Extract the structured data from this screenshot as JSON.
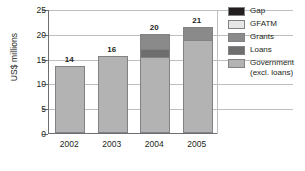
{
  "chart_data": {
    "type": "bar",
    "subtype": "stacked-bar",
    "title": "",
    "xlabel": "",
    "ylabel": "US$ millions",
    "categories": [
      "2002",
      "2003",
      "2004",
      "2005"
    ],
    "ylim": [
      0,
      25
    ],
    "yticks": [
      0,
      5,
      10,
      15,
      20,
      25
    ],
    "ytick_labels": [
      "0",
      "5",
      "10",
      "15",
      "20",
      "25"
    ],
    "grid": true,
    "grid_axis": "y",
    "legend_position": "right",
    "data_labels": [
      "14",
      "16",
      "20",
      "21"
    ],
    "totals": [
      13.5,
      15.5,
      20.0,
      21.4
    ],
    "series": [
      {
        "name": "Government (excl. loans)",
        "legend_label": "Government\n(excl. loans)",
        "color": "#b3b3b3",
        "values": [
          13.5,
          15.5,
          15.4,
          19.0
        ]
      },
      {
        "name": "Loans",
        "legend_label": "Loans",
        "color": "#6e6e6e",
        "values": [
          0,
          0,
          1.6,
          0
        ]
      },
      {
        "name": "Grants",
        "legend_label": "Grants",
        "color": "#8a8a8a",
        "values": [
          0,
          0,
          3.0,
          2.4
        ]
      },
      {
        "name": "GFATM",
        "legend_label": "GFATM",
        "color": "#e6e6e6",
        "values": [
          0,
          0,
          0,
          0
        ]
      },
      {
        "name": "Gap",
        "legend_label": "Gap",
        "color": "#231f20",
        "values": [
          0,
          0,
          0,
          0
        ]
      }
    ],
    "legend": [
      {
        "label": "Gap",
        "color": "#231f20"
      },
      {
        "label": "GFATM",
        "color": "#e6e6e6"
      },
      {
        "label": "Grants",
        "color": "#8a8a8a"
      },
      {
        "label": "Loans",
        "color": "#6e6e6e"
      },
      {
        "label": "Government\n(excl. loans)",
        "color": "#b3b3b3"
      }
    ],
    "axis_color": "#6d6e71",
    "grid_color": "#bcbec0"
  }
}
